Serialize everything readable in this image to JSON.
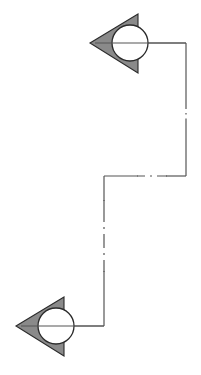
{
  "drawing": {
    "title": "Section Cut Line",
    "type": "engineering-section-indicator",
    "background_color": "#ffffff",
    "line_color": "#555555",
    "outline_color": "#2b2b2b",
    "arrow_fill_color": "#8a8a8a",
    "circle_fill_color": "#ffffff",
    "canvas": {
      "width": 201,
      "height": 375
    }
  },
  "markers": [
    {
      "id": "top-section-marker",
      "label": "",
      "direction": "left",
      "circle": {
        "cx": 130,
        "cy": 43,
        "r": 18
      },
      "arrow": {
        "apex_x": 90,
        "base_x": 138,
        "top_y": 14,
        "bottom_y": 73
      },
      "leader_axis": {
        "x1": 94,
        "y1": 43,
        "x2": 186,
        "y2": 43
      }
    },
    {
      "id": "bottom-section-marker",
      "label": "",
      "direction": "left",
      "circle": {
        "cx": 56,
        "cy": 326,
        "r": 18
      },
      "arrow": {
        "apex_x": 16,
        "base_x": 64,
        "top_y": 297,
        "bottom_y": 356
      },
      "leader_axis": {
        "x1": 20,
        "y1": 326,
        "x2": 104,
        "y2": 326
      }
    }
  ],
  "cut_path": {
    "id": "section-cut-polyline",
    "style": "chain-dash-dot",
    "vertices": [
      {
        "x": 130,
        "y": 43
      },
      {
        "x": 186,
        "y": 43
      },
      {
        "x": 186,
        "y": 176
      },
      {
        "x": 104,
        "y": 176
      },
      {
        "x": 104,
        "y": 326
      },
      {
        "x": 56,
        "y": 326
      }
    ],
    "segments": [
      {
        "name": "top-horizontal",
        "x1": 130,
        "y1": 43,
        "x2": 186,
        "y2": 43,
        "style": "solid"
      },
      {
        "name": "right-vertical-upper",
        "x1": 186,
        "y1": 43,
        "x2": 186,
        "y2": 100,
        "style": "solid"
      },
      {
        "name": "right-vertical-break",
        "x1": 186,
        "y1": 100,
        "x2": 186,
        "y2": 126,
        "style": "dash-dot"
      },
      {
        "name": "right-vertical-lower",
        "x1": 186,
        "y1": 126,
        "x2": 186,
        "y2": 176,
        "style": "solid"
      },
      {
        "name": "mid-horizontal-right",
        "x1": 186,
        "y1": 176,
        "x2": 166,
        "y2": 176,
        "style": "solid"
      },
      {
        "name": "mid-horizontal-break",
        "x1": 166,
        "y1": 176,
        "x2": 138,
        "y2": 176,
        "style": "dash-dot"
      },
      {
        "name": "mid-horizontal-left",
        "x1": 138,
        "y1": 176,
        "x2": 104,
        "y2": 176,
        "style": "solid"
      },
      {
        "name": "left-vertical-upper",
        "x1": 104,
        "y1": 176,
        "x2": 104,
        "y2": 200,
        "style": "solid"
      },
      {
        "name": "left-vertical-break",
        "x1": 104,
        "y1": 200,
        "x2": 104,
        "y2": 272,
        "style": "dash-dot"
      },
      {
        "name": "left-vertical-lower",
        "x1": 104,
        "y1": 272,
        "x2": 104,
        "y2": 326,
        "style": "solid"
      },
      {
        "name": "bottom-horizontal",
        "x1": 104,
        "y1": 326,
        "x2": 56,
        "y2": 326,
        "style": "solid"
      }
    ]
  }
}
